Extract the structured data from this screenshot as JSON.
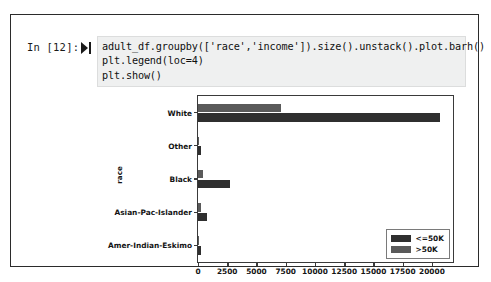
{
  "notebook": {
    "prompt": "In [12]:",
    "run_icon": "run-cell-icon",
    "code_lines": [
      "adult_df.groupby(['race','income']).size().unstack().plot.barh()",
      "plt.legend(loc=4)",
      "plt.show()"
    ]
  },
  "colors": {
    "series_low": "#2f2f2f",
    "series_high": "#5a5a5a",
    "axis": "#3a3a3a",
    "code_background": "#eff0f0",
    "cell_border": "#2b2b2b"
  },
  "chart_data": {
    "type": "bar",
    "orientation": "horizontal",
    "title": "",
    "xlabel": "",
    "ylabel": "race",
    "categories": [
      "Amer-Indian-Eskimo",
      "Asian-Pac-Islander",
      "Black",
      "Other",
      "White"
    ],
    "series": [
      {
        "name": "<=50K",
        "values": [
          275,
          763,
          2737,
          246,
          20699
        ]
      },
      {
        "name": ">50K",
        "values": [
          36,
          276,
          387,
          25,
          7117
        ]
      }
    ],
    "legend": [
      "<=50K",
      ">50K"
    ],
    "legend_position": "lower right",
    "xlim": [
      0,
      21800
    ],
    "xticks": [
      0,
      2500,
      5000,
      7500,
      10000,
      12500,
      15000,
      17500,
      20000
    ],
    "xtick_labels": [
      "0",
      "2500",
      "5000",
      "7500",
      "10000",
      "12500",
      "15000",
      "17500",
      "20000"
    ],
    "grid": false
  }
}
